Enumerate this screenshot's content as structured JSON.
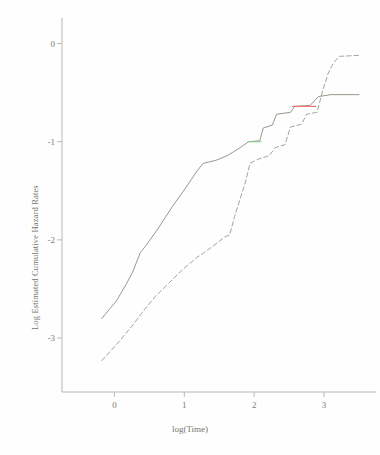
{
  "chart_data": {
    "type": "line",
    "title": "",
    "xlabel": "log(Time)",
    "ylabel": "Log Estimated Cumulative Hazard Rates",
    "xlim": [
      -0.75,
      3.6
    ],
    "ylim": [
      -3.55,
      0.22
    ],
    "xticks": [
      0,
      1,
      2,
      3
    ],
    "xtick_labels": [
      "0",
      "1",
      "2",
      "3"
    ],
    "yticks": [
      0,
      -1,
      -2,
      -3
    ],
    "ytick_labels": [
      "0",
      "-1",
      "-2",
      "-3"
    ],
    "grid": false,
    "legend": "none",
    "series": [
      {
        "name": "group-1-solid",
        "style": "solid",
        "color": "#8c8c80",
        "points": [
          [
            -0.18,
            -2.8
          ],
          [
            0.03,
            -2.62
          ],
          [
            0.17,
            -2.45
          ],
          [
            0.26,
            -2.33
          ],
          [
            0.37,
            -2.13
          ],
          [
            0.46,
            -2.05
          ],
          [
            0.62,
            -1.89
          ],
          [
            0.83,
            -1.66
          ],
          [
            1.02,
            -1.47
          ],
          [
            1.18,
            -1.3
          ],
          [
            1.27,
            -1.22
          ],
          [
            1.45,
            -1.19
          ],
          [
            1.62,
            -1.14
          ],
          [
            1.8,
            -1.06
          ],
          [
            1.92,
            -1.0
          ],
          [
            2.08,
            -0.99
          ],
          [
            2.13,
            -0.86
          ],
          [
            2.26,
            -0.83
          ],
          [
            2.32,
            -0.72
          ],
          [
            2.52,
            -0.7
          ],
          [
            2.58,
            -0.64
          ],
          [
            2.8,
            -0.63
          ],
          [
            2.92,
            -0.54
          ],
          [
            3.1,
            -0.52
          ],
          [
            3.5,
            -0.52
          ]
        ],
        "highlight_segments": [
          {
            "color": "#7fd18a",
            "x_start": 1.92,
            "x_end": 2.1,
            "y": -1.0
          },
          {
            "color": "#e8787a",
            "x_start": 2.55,
            "x_end": 2.88,
            "y": -0.64
          }
        ]
      },
      {
        "name": "group-2-dashed",
        "style": "dashed",
        "color": "#9a9a8e",
        "points": [
          [
            -0.18,
            -3.23
          ],
          [
            0.05,
            -3.05
          ],
          [
            0.25,
            -2.88
          ],
          [
            0.42,
            -2.72
          ],
          [
            0.58,
            -2.58
          ],
          [
            0.78,
            -2.44
          ],
          [
            0.98,
            -2.3
          ],
          [
            1.18,
            -2.18
          ],
          [
            1.4,
            -2.07
          ],
          [
            1.58,
            -1.97
          ],
          [
            1.65,
            -1.95
          ],
          [
            1.72,
            -1.76
          ],
          [
            1.8,
            -1.58
          ],
          [
            1.88,
            -1.4
          ],
          [
            1.94,
            -1.22
          ],
          [
            2.05,
            -1.18
          ],
          [
            2.22,
            -1.14
          ],
          [
            2.3,
            -1.06
          ],
          [
            2.44,
            -1.03
          ],
          [
            2.52,
            -0.85
          ],
          [
            2.68,
            -0.82
          ],
          [
            2.75,
            -0.72
          ],
          [
            2.9,
            -0.7
          ],
          [
            2.98,
            -0.48
          ],
          [
            3.06,
            -0.3
          ],
          [
            3.14,
            -0.19
          ],
          [
            3.22,
            -0.13
          ],
          [
            3.5,
            -0.12
          ]
        ],
        "highlight_segments": []
      }
    ]
  },
  "axes": {
    "x_axis_name": "x-axis",
    "y_axis_name": "y-axis"
  }
}
